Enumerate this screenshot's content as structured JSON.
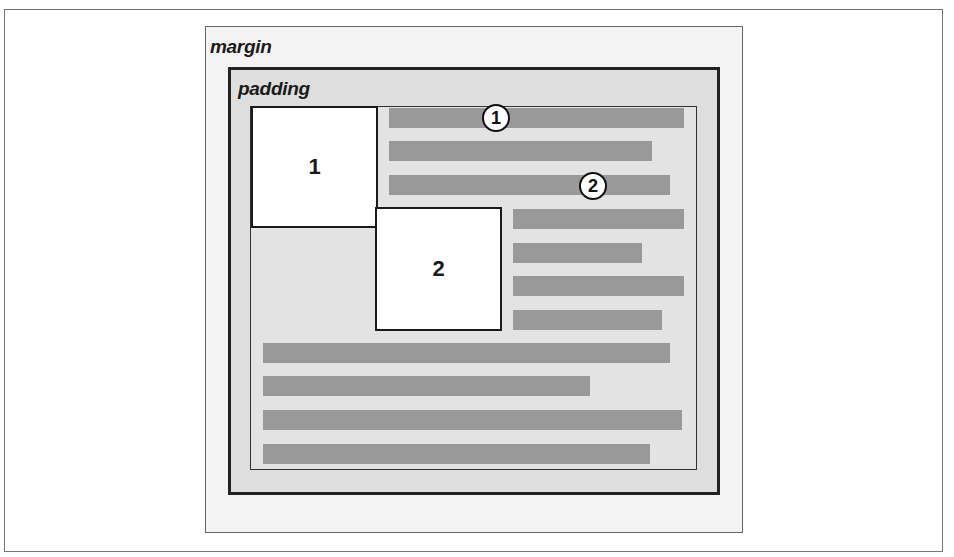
{
  "diagram": {
    "labels": {
      "margin": "margin",
      "padding": "padding"
    },
    "floats": [
      {
        "label": "1",
        "x": 251,
        "y": 106,
        "w": 127,
        "h": 122
      },
      {
        "label": "2",
        "x": 375,
        "y": 207,
        "w": 127,
        "h": 124
      }
    ],
    "callouts": [
      {
        "label": "1",
        "cx": 496,
        "cy": 118
      },
      {
        "label": "2",
        "cx": 593,
        "cy": 186
      }
    ],
    "text_lines": [
      {
        "x": 389,
        "y": 108,
        "w": 295
      },
      {
        "x": 389,
        "y": 141,
        "w": 263
      },
      {
        "x": 389,
        "y": 175,
        "w": 281
      },
      {
        "x": 513,
        "y": 209,
        "w": 171
      },
      {
        "x": 513,
        "y": 243,
        "w": 129
      },
      {
        "x": 513,
        "y": 276,
        "w": 171
      },
      {
        "x": 513,
        "y": 310,
        "w": 149
      },
      {
        "x": 263,
        "y": 343,
        "w": 407
      },
      {
        "x": 263,
        "y": 376,
        "w": 327
      },
      {
        "x": 263,
        "y": 410,
        "w": 419
      },
      {
        "x": 263,
        "y": 444,
        "w": 387
      }
    ],
    "colors": {
      "margin_bg": "#f3f3f3",
      "padding_bg": "#dedede",
      "content_bg": "#e3e3e3",
      "text_line": "#999999",
      "float_bg": "#ffffff",
      "stroke": "#1a1a1a"
    }
  }
}
